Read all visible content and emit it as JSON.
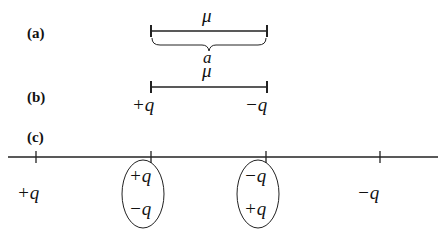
{
  "panels": {
    "a": {
      "label": "(a)",
      "top_symbol": "μ",
      "bottom_symbol": "a"
    },
    "b": {
      "label": "(b)",
      "top_symbol": "μ",
      "left_charge": "+q",
      "right_charge": "−q"
    },
    "c": {
      "label": "(c)",
      "outer_left_charge": "+q",
      "outer_right_charge": "−q",
      "ellipse_left": {
        "top": "+q",
        "bottom": "−q"
      },
      "ellipse_right": {
        "top": "−q",
        "bottom": "+q"
      }
    }
  }
}
